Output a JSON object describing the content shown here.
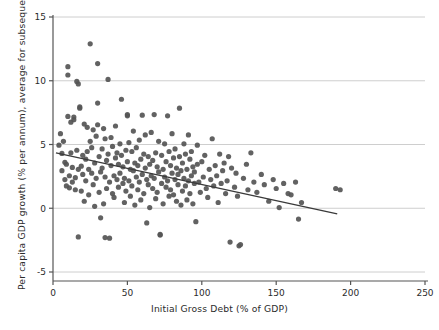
{
  "chart_data": {
    "type": "scatter",
    "title": "",
    "xlabel": "Initial Gross Debt (% of GDP)",
    "ylabel": "Per capita GDP growth (% per annum), average for subsequent 5 years",
    "xlim": [
      0,
      250
    ],
    "ylim": [
      -5,
      15
    ],
    "xticks": [
      0,
      50,
      100,
      150,
      200,
      250
    ],
    "yticks": [
      -5,
      0,
      5,
      10,
      15
    ],
    "grid": "horizontal",
    "legend": "none",
    "point_color": "#555555",
    "line_color": "#3a3a3a",
    "grid_color": "#c8c8c8",
    "axis_color": "#555555",
    "trendline": {
      "type": "linear-fit",
      "x_start": 2,
      "y_start": 4.35,
      "x_end": 191,
      "y_end": -0.45
    },
    "series": [
      {
        "name": "Country-year observations",
        "points": [
          [
            4,
            4.95
          ],
          [
            5,
            5.85
          ],
          [
            6,
            2.95
          ],
          [
            6,
            4.3
          ],
          [
            7,
            5.25
          ],
          [
            8,
            2.25
          ],
          [
            8,
            3.6
          ],
          [
            9,
            1.75
          ],
          [
            9,
            3.45
          ],
          [
            10,
            11.1
          ],
          [
            10,
            10.45
          ],
          [
            10,
            7.2
          ],
          [
            11,
            2.55
          ],
          [
            11,
            1.6
          ],
          [
            12,
            6.75
          ],
          [
            12,
            4.35
          ],
          [
            13,
            2.05
          ],
          [
            13,
            3.2
          ],
          [
            14,
            7.15
          ],
          [
            14,
            6.95
          ],
          [
            15,
            1.45
          ],
          [
            15,
            2.4
          ],
          [
            16,
            9.95
          ],
          [
            16,
            4.55
          ],
          [
            17,
            9.75
          ],
          [
            17,
            3.05
          ],
          [
            17,
            -2.25
          ],
          [
            18,
            7.85
          ],
          [
            18,
            7.95
          ],
          [
            19,
            3.3
          ],
          [
            19,
            1.35
          ],
          [
            20,
            4.15
          ],
          [
            20,
            2.65
          ],
          [
            21,
            6.6
          ],
          [
            21,
            0.55
          ],
          [
            22,
            3.85
          ],
          [
            22,
            2.15
          ],
          [
            23,
            6.35
          ],
          [
            23,
            4.45
          ],
          [
            24,
            1.05
          ],
          [
            24,
            3.05
          ],
          [
            25,
            12.9
          ],
          [
            25,
            5.25
          ],
          [
            26,
            2.75
          ],
          [
            26,
            4.75
          ],
          [
            27,
            6.15
          ],
          [
            27,
            1.85
          ],
          [
            28,
            0.15
          ],
          [
            28,
            3.55
          ],
          [
            29,
            5.65
          ],
          [
            29,
            2.35
          ],
          [
            30,
            11.35
          ],
          [
            30,
            8.25
          ],
          [
            30,
            6.55
          ],
          [
            31,
            4.05
          ],
          [
            31,
            1.25
          ],
          [
            32,
            -0.75
          ],
          [
            32,
            2.85
          ],
          [
            33,
            4.65
          ],
          [
            33,
            3.15
          ],
          [
            34,
            6.25
          ],
          [
            34,
            0.35
          ],
          [
            35,
            5.45
          ],
          [
            35,
            2.45
          ],
          [
            35,
            -2.3
          ],
          [
            36,
            3.75
          ],
          [
            36,
            1.55
          ],
          [
            37,
            10.1
          ],
          [
            37,
            4.25
          ],
          [
            38,
            2.05
          ],
          [
            38,
            -2.35
          ],
          [
            39,
            5.55
          ],
          [
            39,
            3.35
          ],
          [
            40,
            1.15
          ],
          [
            40,
            4.85
          ],
          [
            41,
            2.55
          ],
          [
            41,
            0.85
          ],
          [
            42,
            6.45
          ],
          [
            42,
            3.95
          ],
          [
            43,
            2.25
          ],
          [
            43,
            4.35
          ],
          [
            44,
            1.65
          ],
          [
            44,
            3.45
          ],
          [
            45,
            5.05
          ],
          [
            45,
            2.75
          ],
          [
            46,
            8.55
          ],
          [
            46,
            4.15
          ],
          [
            47,
            1.95
          ],
          [
            47,
            3.25
          ],
          [
            48,
            0.45
          ],
          [
            48,
            2.35
          ],
          [
            49,
            4.55
          ],
          [
            49,
            1.35
          ],
          [
            50,
            7.25
          ],
          [
            50,
            7.35
          ],
          [
            50,
            3.65
          ],
          [
            51,
            2.15
          ],
          [
            51,
            5.15
          ],
          [
            52,
            0.95
          ],
          [
            52,
            3.05
          ],
          [
            53,
            4.45
          ],
          [
            53,
            1.75
          ],
          [
            54,
            2.95
          ],
          [
            54,
            6.05
          ],
          [
            55,
            3.55
          ],
          [
            55,
            0.25
          ],
          [
            56,
            2.45
          ],
          [
            56,
            4.75
          ],
          [
            57,
            1.45
          ],
          [
            57,
            3.35
          ],
          [
            58,
            5.35
          ],
          [
            58,
            2.05
          ],
          [
            59,
            0.65
          ],
          [
            59,
            3.85
          ],
          [
            60,
            7.3
          ],
          [
            60,
            2.65
          ],
          [
            61,
            4.25
          ],
          [
            61,
            1.15
          ],
          [
            62,
            3.15
          ],
          [
            62,
            5.75
          ],
          [
            63,
            2.25
          ],
          [
            63,
            -1.15
          ],
          [
            64,
            4.05
          ],
          [
            64,
            1.85
          ],
          [
            65,
            3.45
          ],
          [
            65,
            0.05
          ],
          [
            66,
            2.55
          ],
          [
            66,
            5.95
          ],
          [
            67,
            1.55
          ],
          [
            67,
            3.75
          ],
          [
            68,
            7.35
          ],
          [
            68,
            2.35
          ],
          [
            69,
            4.35
          ],
          [
            69,
            0.75
          ],
          [
            70,
            3.25
          ],
          [
            70,
            1.25
          ],
          [
            71,
            2.85
          ],
          [
            71,
            5.25
          ],
          [
            72,
            -2.05
          ],
          [
            72,
            -2.1
          ],
          [
            73,
            1.95
          ],
          [
            73,
            4.15
          ],
          [
            74,
            3.05
          ],
          [
            74,
            0.35
          ],
          [
            75,
            2.45
          ],
          [
            75,
            5.05
          ],
          [
            76,
            1.65
          ],
          [
            76,
            3.65
          ],
          [
            77,
            7.25
          ],
          [
            77,
            2.15
          ],
          [
            78,
            4.45
          ],
          [
            78,
            0.95
          ],
          [
            79,
            3.35
          ],
          [
            79,
            1.45
          ],
          [
            80,
            2.75
          ],
          [
            80,
            5.85
          ],
          [
            81,
            1.05
          ],
          [
            81,
            3.95
          ],
          [
            82,
            2.25
          ],
          [
            82,
            4.65
          ],
          [
            83,
            0.55
          ],
          [
            83,
            3.15
          ],
          [
            84,
            1.85
          ],
          [
            84,
            2.65
          ],
          [
            85,
            7.85
          ],
          [
            85,
            4.05
          ],
          [
            86,
            2.95
          ],
          [
            86,
            0.25
          ],
          [
            87,
            3.55
          ],
          [
            87,
            1.35
          ],
          [
            88,
            2.35
          ],
          [
            88,
            5.05
          ],
          [
            89,
            1.75
          ],
          [
            89,
            4.25
          ],
          [
            90,
            3.05
          ],
          [
            90,
            0.65
          ],
          [
            91,
            5.75
          ],
          [
            91,
            2.15
          ],
          [
            92,
            3.85
          ],
          [
            92,
            1.15
          ],
          [
            93,
            2.55
          ],
          [
            93,
            4.45
          ],
          [
            94,
            0.35
          ],
          [
            94,
            3.25
          ],
          [
            95,
            1.95
          ],
          [
            95,
            2.85
          ],
          [
            96,
            -1.05
          ],
          [
            97,
            4.95
          ],
          [
            97,
            3.45
          ],
          [
            98,
            2.05
          ],
          [
            99,
            1.25
          ],
          [
            100,
            3.65
          ],
          [
            101,
            2.45
          ],
          [
            102,
            4.15
          ],
          [
            103,
            1.55
          ],
          [
            104,
            0.85
          ],
          [
            105,
            3.05
          ],
          [
            106,
            2.25
          ],
          [
            107,
            5.45
          ],
          [
            108,
            1.75
          ],
          [
            109,
            3.35
          ],
          [
            110,
            2.55
          ],
          [
            111,
            0.45
          ],
          [
            112,
            4.25
          ],
          [
            113,
            1.95
          ],
          [
            114,
            2.95
          ],
          [
            115,
            3.55
          ],
          [
            116,
            1.15
          ],
          [
            117,
            2.15
          ],
          [
            118,
            4.05
          ],
          [
            119,
            -2.65
          ],
          [
            120,
            3.15
          ],
          [
            122,
            1.65
          ],
          [
            123,
            2.75
          ],
          [
            124,
            0.95
          ],
          [
            125,
            -2.95
          ],
          [
            126,
            -2.85
          ],
          [
            128,
            2.35
          ],
          [
            130,
            3.45
          ],
          [
            131,
            1.45
          ],
          [
            133,
            4.35
          ],
          [
            135,
            2.05
          ],
          [
            137,
            1.25
          ],
          [
            140,
            2.65
          ],
          [
            142,
            1.85
          ],
          [
            145,
            0.55
          ],
          [
            148,
            2.25
          ],
          [
            150,
            1.55
          ],
          [
            152,
            0.05
          ],
          [
            155,
            1.95
          ],
          [
            158,
            1.15
          ],
          [
            160,
            1.05
          ],
          [
            163,
            2.05
          ],
          [
            165,
            -0.85
          ],
          [
            167,
            0.45
          ],
          [
            190,
            1.55
          ],
          [
            193,
            1.45
          ]
        ]
      }
    ]
  }
}
